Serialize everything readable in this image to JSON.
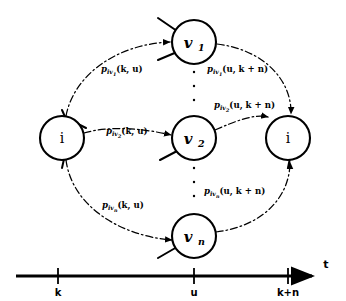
{
  "figure": {
    "title": "",
    "background_color": "#ffffff",
    "stroke_color": "#000000"
  },
  "nodes": [
    {
      "id": "i-left",
      "label": "i",
      "sub": "",
      "cx": 62,
      "cy": 138,
      "r": 22
    },
    {
      "id": "v1",
      "label": "v",
      "sub": "1",
      "cx": 194,
      "cy": 42,
      "r": 22
    },
    {
      "id": "v2",
      "label": "v",
      "sub": "2",
      "cx": 194,
      "cy": 138,
      "r": 22
    },
    {
      "id": "vn",
      "label": "v",
      "sub": "n",
      "cx": 194,
      "cy": 236,
      "r": 22
    },
    {
      "id": "i-right",
      "label": "i",
      "sub": "",
      "cx": 288,
      "cy": 138,
      "r": 22
    }
  ],
  "edge_labels": [
    {
      "id": "p-iv1-k-u",
      "p": "p",
      "sub": "iv",
      "subsub": "1",
      "args": "(k, u)",
      "x": 101,
      "y": 72
    },
    {
      "id": "p-iv1-u-kn",
      "p": "p",
      "sub": "iv",
      "subsub": "1",
      "args": "(u, k + n)",
      "x": 207,
      "y": 72
    },
    {
      "id": "p-iv2-k-u",
      "p": "p",
      "sub": "iv",
      "subsub": "2",
      "args": "(k, u)",
      "x": 106,
      "y": 134
    },
    {
      "id": "p-iv2-u-kn",
      "p": "p",
      "sub": "iv",
      "subsub": "2",
      "args": "(u, k + n)",
      "x": 214,
      "y": 108
    },
    {
      "id": "p-ivn-k-u",
      "p": "p",
      "sub": "iv",
      "subsub": "n",
      "args": "(k, u)",
      "x": 102,
      "y": 208
    },
    {
      "id": "p-ivn-u-kn",
      "p": "p",
      "sub": "iv",
      "subsub": "n",
      "args": "(u, k + n)",
      "x": 204,
      "y": 194
    }
  ],
  "ellipses": [
    {
      "id": "ellipsis-upper",
      "cx": 194,
      "dots_y": [
        72,
        86,
        100
      ]
    },
    {
      "id": "ellipsis-lower",
      "cx": 194,
      "dots_y": [
        168,
        182,
        196
      ]
    }
  ],
  "axis": {
    "name": "t",
    "name_x": 326,
    "name_y": 268,
    "y": 276,
    "x_start": 16,
    "x_end": 312,
    "ticks": [
      {
        "label": "k",
        "x": 58
      },
      {
        "label": "u",
        "x": 194
      },
      {
        "label": "k+n",
        "x": 288
      }
    ]
  },
  "edges": [
    {
      "id": "edge-ileft-v1",
      "from": "i-left",
      "to": "v1",
      "phase": "forward"
    },
    {
      "id": "edge-ileft-v2",
      "from": "i-left",
      "to": "v2",
      "phase": "forward"
    },
    {
      "id": "edge-ileft-vn",
      "from": "i-left",
      "to": "vn",
      "phase": "forward"
    },
    {
      "id": "edge-v1-iright",
      "from": "v1",
      "to": "i-right",
      "phase": "backward"
    },
    {
      "id": "edge-v2-iright",
      "from": "v2",
      "to": "i-right",
      "phase": "backward"
    },
    {
      "id": "edge-vn-iright",
      "from": "vn",
      "to": "i-right",
      "phase": "backward"
    }
  ]
}
